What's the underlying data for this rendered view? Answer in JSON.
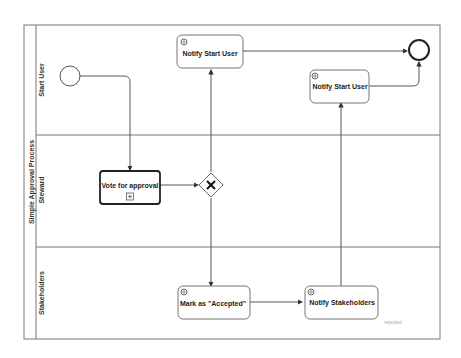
{
  "pool": {
    "label": "Simple Approval Process"
  },
  "lanes": [
    {
      "label": "Start User"
    },
    {
      "label": "Steward"
    },
    {
      "label": "Stakeholders"
    }
  ],
  "tasks": {
    "notify_start_user_1": {
      "label": "Notify Start User",
      "icon": "gear-icon"
    },
    "notify_start_user_2": {
      "label": "Notify Start User",
      "icon": "gear-icon"
    },
    "vote_for_approval": {
      "label": "Vote for approval",
      "marker": "subprocess-plus-icon"
    },
    "mark_accepted": {
      "label": "Mark as \"Accepted\"",
      "icon": "gear-icon"
    },
    "notify_stakeholders": {
      "label": "Notify Stakeholders",
      "icon": "gear-icon"
    }
  },
  "gateway": {
    "type": "exclusive",
    "icon": "x-icon"
  },
  "annotations": {
    "rejected": "rejected"
  },
  "colors": {
    "stroke": "#555555",
    "text": "#222222",
    "faint": "#aaaaaa"
  }
}
